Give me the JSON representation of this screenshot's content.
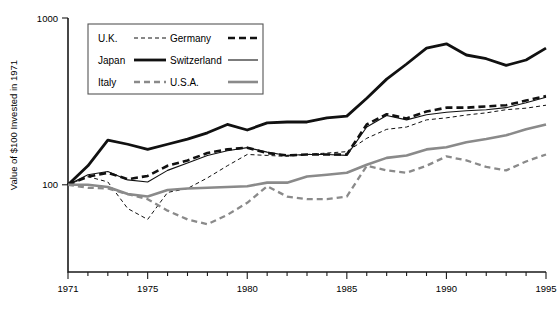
{
  "chart_data": {
    "type": "line",
    "title": "",
    "xlabel": "",
    "ylabel": "Value of $100 Invested in 1971",
    "yscale": "log",
    "ylim": [
      30,
      1000
    ],
    "xlim": [
      1971,
      1995
    ],
    "grid": false,
    "legend_position": "top-left",
    "ytick_labels": [
      "1000",
      "100"
    ],
    "ytick_values": [
      1000,
      100
    ],
    "xtick_labels": [
      "1971",
      "1975",
      "1980",
      "1985",
      "1990",
      "1995"
    ],
    "xtick_values": [
      1971,
      1975,
      1980,
      1985,
      1990,
      1995
    ],
    "x": [
      1971,
      1972,
      1973,
      1974,
      1975,
      1976,
      1977,
      1978,
      1979,
      1980,
      1981,
      1982,
      1983,
      1984,
      1985,
      1986,
      1987,
      1988,
      1989,
      1990,
      1991,
      1992,
      1993,
      1994,
      1995
    ],
    "series": [
      {
        "name": "Japan",
        "style": "thick-solid-black",
        "color": "#111111",
        "width": 2.8,
        "dash": "",
        "values": [
          100,
          130,
          185,
          175,
          163,
          175,
          188,
          205,
          230,
          213,
          235,
          238,
          238,
          252,
          258,
          330,
          430,
          530,
          660,
          700,
          600,
          570,
          520,
          560,
          660
        ]
      },
      {
        "name": "Germany",
        "style": "thick-dashed-black",
        "color": "#111111",
        "width": 2.6,
        "dash": "7,4",
        "values": [
          100,
          112,
          118,
          108,
          113,
          130,
          140,
          155,
          163,
          167,
          155,
          150,
          152,
          152,
          152,
          230,
          265,
          250,
          275,
          290,
          290,
          295,
          300,
          320,
          340
        ]
      },
      {
        "name": "Switzerland",
        "style": "thin-solid-black",
        "color": "#111111",
        "width": 1.1,
        "dash": "",
        "values": [
          100,
          115,
          120,
          107,
          104,
          122,
          135,
          150,
          160,
          167,
          157,
          150,
          152,
          152,
          150,
          222,
          260,
          245,
          263,
          272,
          278,
          282,
          290,
          310,
          335
        ]
      },
      {
        "name": "U.K.",
        "style": "thin-dashed-black",
        "color": "#111111",
        "width": 1.0,
        "dash": "4,3",
        "values": [
          100,
          112,
          104,
          72,
          62,
          90,
          95,
          110,
          130,
          152,
          150,
          148,
          152,
          155,
          158,
          190,
          215,
          222,
          245,
          252,
          262,
          270,
          282,
          288,
          300
        ]
      },
      {
        "name": "U.S.A.",
        "style": "thick-solid-gray",
        "color": "#8a8a8a",
        "width": 2.6,
        "dash": "",
        "values": [
          100,
          100,
          97,
          88,
          85,
          93,
          95,
          96,
          97,
          98,
          103,
          103,
          112,
          115,
          118,
          132,
          145,
          150,
          163,
          168,
          180,
          188,
          198,
          215,
          230
        ]
      },
      {
        "name": "Italy",
        "style": "thick-dashed-gray",
        "color": "#8a8a8a",
        "width": 2.3,
        "dash": "6,4",
        "values": [
          100,
          96,
          95,
          88,
          82,
          70,
          62,
          58,
          66,
          78,
          98,
          85,
          82,
          82,
          85,
          130,
          122,
          118,
          130,
          148,
          140,
          128,
          122,
          138,
          152
        ]
      }
    ],
    "legend_entries": [
      {
        "label": "U.K.",
        "style": "thin-dashed-black"
      },
      {
        "label": "Germany",
        "style": "thick-dashed-black"
      },
      {
        "label": "Japan",
        "style": "thick-solid-black"
      },
      {
        "label": "Switzerland",
        "style": "thin-solid-black"
      },
      {
        "label": "Italy",
        "style": "thick-dashed-gray"
      },
      {
        "label": "U.S.A.",
        "style": "thick-solid-gray"
      }
    ]
  }
}
